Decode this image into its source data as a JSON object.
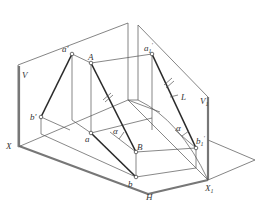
{
  "diagram": {
    "type": "descriptive-geometry-projection",
    "colors": {
      "line": "#555555",
      "thick_line": "#2a2a2a",
      "label": "#333333",
      "background": "#ffffff"
    },
    "planes": {
      "V": "V",
      "V1": "V",
      "V1_sub": "1",
      "H": "H"
    },
    "axes": {
      "X": "X",
      "X1": "X",
      "X1_sub": "1"
    },
    "points": {
      "a_prime": "a'",
      "A": "A",
      "a1_prime": "a",
      "a1_prime_sub": "1",
      "a1_prime_sup": "'",
      "b_prime": "b'",
      "a": "a",
      "B": "B",
      "b": "b",
      "b1_prime": "b",
      "b1_prime_sub": "1",
      "b1_prime_sup": "'"
    },
    "line_label": "L",
    "angles": {
      "alpha_h": "α",
      "alpha_v1": "α"
    }
  }
}
